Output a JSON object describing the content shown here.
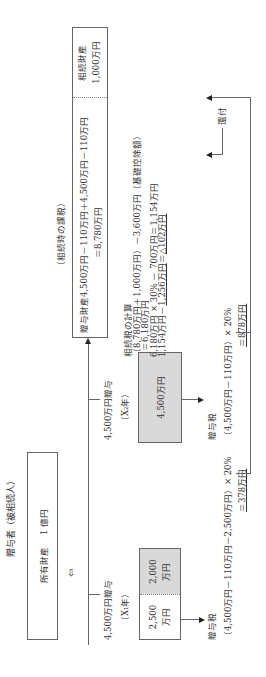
{
  "donor": {
    "title": "贈与者（被相続人）",
    "assets_label": "所有財産",
    "assets_value": "1 億円",
    "down_arrow": "⇩"
  },
  "gift1": {
    "label": "4,500万円贈与",
    "year": "（X₁年）",
    "box_white": "2,500",
    "box_white_unit": "万円",
    "box_gray": "2,000",
    "box_gray_unit": "万円",
    "tax_title": "贈与税",
    "tax_formula": "（4,500万円－110万円－2,500万円）× 20%",
    "tax_result": "＝378万円"
  },
  "gift2": {
    "label": "4,500万円贈与",
    "year": "（X₂年）",
    "box": "4,500万円",
    "tax_title": "贈与税",
    "tax_formula": "（4,500万円－110万円）× 20%",
    "tax_result": "＝878万円"
  },
  "inheritance": {
    "heading": "（相続時の課税）",
    "gift_assets_line1": "贈与財産4,500万円－110万円＋4,500万円－110万円",
    "gift_assets_line2": "＝8,780万円",
    "estate_label": "相続財産",
    "estate_value": "1,000万円"
  },
  "calc": {
    "title": "相続税の計算",
    "line1": "（8,780万円＋1,000万円）－3,600万円（基礎控除額）",
    "line2": "＝6,180万円",
    "line3": "6,180万円 × 30% － 700万円＝1,154万円",
    "line4_prefix": "1,154万円－",
    "line4_underlined": "1,256万円",
    "line4_eq": "＝",
    "line4_result": "△102万円"
  },
  "refund": {
    "label": "還付"
  }
}
